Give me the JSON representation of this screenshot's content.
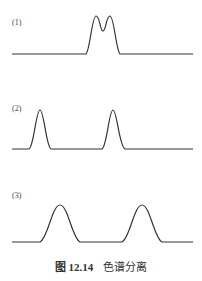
{
  "figure": {
    "caption_number": "图 12.14",
    "caption_text": "色谱分离",
    "panels": [
      {
        "label": "(1)",
        "description": "two overlapping peaks, unresolved"
      },
      {
        "label": "(2)",
        "description": "two narrow peaks, well separated"
      },
      {
        "label": "(3)",
        "description": "two broad peaks, separated"
      }
    ],
    "line_color": "#333333"
  }
}
